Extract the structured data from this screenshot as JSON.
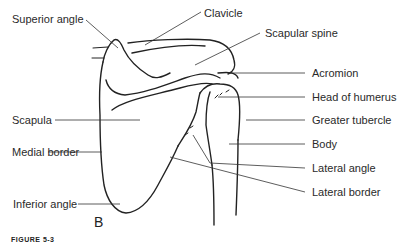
{
  "figure": {
    "panel_letter": "B",
    "caption_fragment": "FIGURE 5-3",
    "line_color": "#222222"
  },
  "labels": {
    "superior_angle": "Superior angle",
    "clavicle": "Clavicle",
    "scapular_spine": "Scapular spine",
    "acromion": "Acromion",
    "head_of_humerus": "Head of humerus",
    "scapula": "Scapula",
    "greater_tubercle": "Greater tubercle",
    "medial_border": "Medial border",
    "body": "Body",
    "lateral_angle": "Lateral angle",
    "lateral_border": "Lateral border",
    "inferior_angle": "Inferior angle"
  }
}
